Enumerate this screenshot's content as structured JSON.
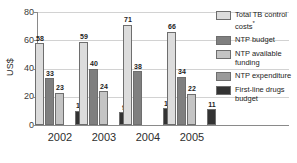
{
  "chart_data": {
    "type": "bar",
    "title": "",
    "xlabel": "",
    "ylabel": "US$",
    "ylim": [
      0,
      80
    ],
    "yticks": [
      0,
      20,
      40,
      60,
      80
    ],
    "grid": true,
    "legend_position": "right",
    "categories": [
      "2002",
      "2003",
      "2004",
      "2005"
    ],
    "series": [
      {
        "name": "Total TB control costs*",
        "key": "total-tb-control-costs",
        "color": "#dcdcdc",
        "values": [
          58,
          59,
          71,
          66
        ]
      },
      {
        "name": "NTP budget",
        "key": "ntp-budget",
        "color": "#7f7f7f",
        "values": [
          33,
          40,
          38,
          34
        ]
      },
      {
        "name": "NTP available funding",
        "key": "ntp-available-funding",
        "color": "#c4c4c4",
        "values": [
          23,
          24,
          null,
          22
        ]
      },
      {
        "name": "NTP expenditure",
        "key": "ntp-expenditure",
        "color": "#9a9a9a",
        "values": [
          null,
          null,
          null,
          null
        ]
      },
      {
        "name": "First-line drugs budget",
        "key": "first-line-drugs-budget",
        "color": "#333333",
        "values": [
          10,
          9,
          12,
          11
        ]
      }
    ],
    "bar_labels": {
      "2002": [
        "58",
        "33",
        "23",
        "",
        "10"
      ],
      "2003": [
        "59",
        "40",
        "24",
        "",
        "9"
      ],
      "2004": [
        "71",
        "38",
        "",
        "",
        "12"
      ],
      "2005": [
        "66",
        "34",
        "22",
        "",
        "11"
      ]
    }
  },
  "axis": {
    "y_label": "US$",
    "y_ticks": [
      "80",
      "60",
      "40",
      "20",
      "0"
    ],
    "x_ticks": [
      "2002",
      "2003",
      "2004",
      "2005"
    ]
  },
  "legend": {
    "items": [
      {
        "label": "Total TB control",
        "label2": "costs",
        "sup": "*",
        "color": "#dcdcdc",
        "key": "total-tb-control-costs"
      },
      {
        "label": "NTP budget",
        "label2": "",
        "sup": "",
        "color": "#7f7f7f",
        "key": "ntp-budget"
      },
      {
        "label": "NTP available",
        "label2": "funding",
        "sup": "",
        "color": "#c4c4c4",
        "key": "ntp-available-funding"
      },
      {
        "label": "NTP expenditure",
        "label2": "",
        "sup": "",
        "color": "#9a9a9a",
        "key": "ntp-expenditure"
      },
      {
        "label": "First-line drugs",
        "label2": "budget",
        "sup": "",
        "color": "#333333",
        "key": "first-line-drugs-budget"
      }
    ]
  }
}
